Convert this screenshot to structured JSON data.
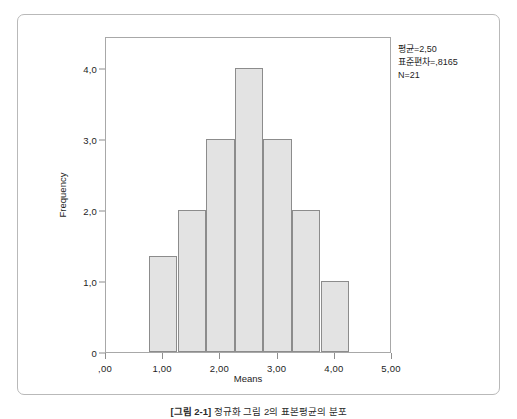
{
  "figure": {
    "caption_label": "[그림 2-1]",
    "caption_text": "정규화 그림 2의 표본평균의 분포"
  },
  "stats": {
    "mean_line": "평균=2,50",
    "sd_line": "표준편차=,8165",
    "n_line": "N=21"
  },
  "chart_data": {
    "type": "bar",
    "title": "",
    "subtitle": "",
    "xlabel": "Means",
    "ylabel": "Frequency",
    "xlim": [
      0,
      5
    ],
    "ylim": [
      0,
      4.45
    ],
    "grid": false,
    "legend": null,
    "bin_width": 0.5,
    "x_tick_labels": [
      ",00",
      "1,00",
      "2,00",
      "3,00",
      "4,00",
      "5,00"
    ],
    "x_tick_values": [
      0,
      1,
      2,
      3,
      4,
      5
    ],
    "y_tick_labels": [
      "0",
      "1,0",
      "2,0",
      "3,0",
      "4,0"
    ],
    "y_tick_values": [
      0,
      1,
      2,
      3,
      4
    ],
    "categories": [
      "1,00",
      "1,50",
      "2,00",
      "2,50",
      "3,00",
      "3,50",
      "4,00"
    ],
    "bin_centers": [
      1.0,
      1.5,
      2.0,
      2.5,
      3.0,
      3.5,
      4.0
    ],
    "bin_starts": [
      0.75,
      1.25,
      1.75,
      2.25,
      2.75,
      3.25,
      3.75
    ],
    "values": [
      1.35,
      2.0,
      3.0,
      4.0,
      3.0,
      2.0,
      1.0
    ],
    "annotations": [
      "평균=2,50",
      "표준편차=,8165",
      "N=21"
    ],
    "bar_fill": "#e3e3e3",
    "bar_border": "#8c8c8c",
    "frame_color": "#a8a8a8"
  }
}
